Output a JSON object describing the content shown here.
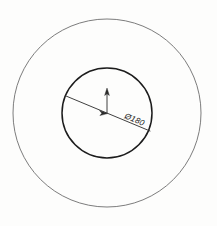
{
  "drawing": {
    "title": "Concentric Circles Technical Drawing",
    "background_color": "#fdfdfc",
    "outer_circle": {
      "name": "outer-circle",
      "center_x": 107,
      "center_y": 113,
      "radius": 94,
      "stroke_color": "#6d6d6d",
      "stroke_width": 0.9,
      "fill": "none"
    },
    "inner_circle": {
      "name": "inner-circle",
      "center_x": 107,
      "center_y": 113,
      "radius": 45,
      "stroke_color": "#1c1c1c",
      "stroke_width": 1.5,
      "fill": "none"
    },
    "diameter_line": {
      "name": "diameter-dimension-line",
      "x1": 66,
      "y1": 96,
      "x2": 150,
      "y2": 131,
      "stroke_color": "#2a2a2a",
      "stroke_width": 0.9,
      "angle_degrees": 22.6
    },
    "leader_arrow": {
      "name": "vertical-leader-arrow",
      "x1": 107,
      "y1": 113,
      "x2": 107,
      "y2": 89,
      "stroke_color": "#2a2a2a",
      "stroke_width": 0.9,
      "direction": "up"
    },
    "center_arrowhead": {
      "name": "diameter-arrowhead",
      "x": 106,
      "y": 113,
      "points_toward": "left"
    },
    "dimension_label": {
      "name": "diameter-dimension-label",
      "text": "Ø180",
      "symbol": "Ø",
      "value": "180",
      "x": 124,
      "y": 118,
      "rotation_degrees": 22.6,
      "font_size": 8.2,
      "color": "#1a1a1a"
    }
  }
}
